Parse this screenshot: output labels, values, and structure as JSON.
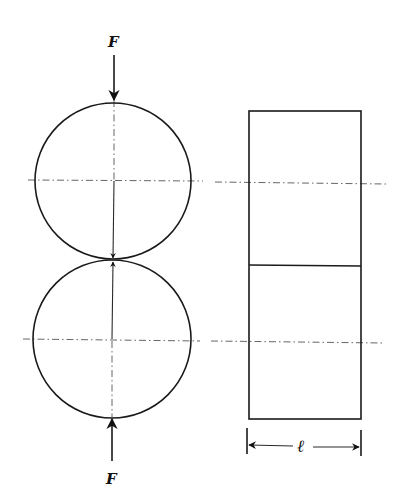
{
  "figure": {
    "labels": {
      "force_top": "F",
      "force_bottom": "F",
      "length": "ℓ"
    },
    "geometry": {
      "top_circle": {
        "cx": 113,
        "cy": 181,
        "r": 78
      },
      "bottom_circle": {
        "cx": 112,
        "cy": 339,
        "r": 79
      },
      "contact_point": {
        "x": 113,
        "y": 260
      },
      "rectangle": {
        "x": 249,
        "y": 111,
        "width": 112,
        "height": 308,
        "divider_y": 265
      },
      "centerline_top_y": 181,
      "centerline_bottom_y": 341
    },
    "colors": {
      "line": "#1a1a1a",
      "centerline": "#555555",
      "background": "#ffffff"
    }
  }
}
